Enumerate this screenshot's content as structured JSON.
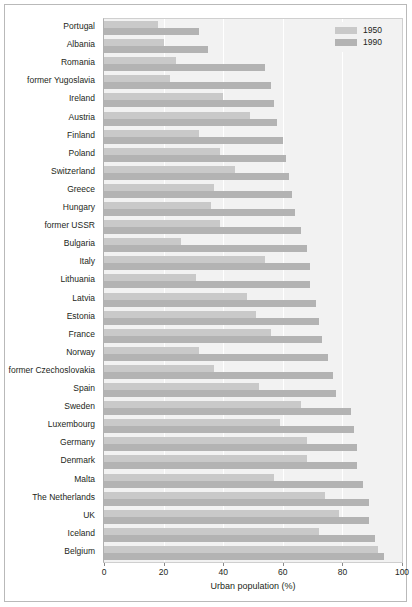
{
  "chart_data": {
    "type": "bar",
    "orientation": "horizontal",
    "title": "",
    "xlabel": "Urban population (%)",
    "ylabel": "",
    "xlim": [
      0,
      100
    ],
    "xticks": [
      0,
      20,
      40,
      60,
      80,
      100
    ],
    "grid": true,
    "legend_position": "top-right",
    "categories": [
      "Portugal",
      "Albania",
      "Romania",
      "former Yugoslavia",
      "Ireland",
      "Austria",
      "Finland",
      "Poland",
      "Switzerland",
      "Greece",
      "Hungary",
      "former USSR",
      "Bulgaria",
      "Italy",
      "Lithuania",
      "Latvia",
      "Estonia",
      "France",
      "Norway",
      "former Czechoslovakia",
      "Spain",
      "Sweden",
      "Luxembourg",
      "Germany",
      "Denmark",
      "Malta",
      "The Netherlands",
      "UK",
      "Iceland",
      "Belgium"
    ],
    "series": [
      {
        "name": "1950",
        "color": "#c9c9c9",
        "values": [
          18,
          20,
          24,
          22,
          40,
          49,
          32,
          39,
          44,
          37,
          36,
          39,
          26,
          54,
          31,
          48,
          51,
          56,
          32,
          37,
          52,
          66,
          59,
          68,
          68,
          57,
          74,
          79,
          72,
          92
        ]
      },
      {
        "name": "1990",
        "color": "#b3b3b3",
        "values": [
          32,
          35,
          54,
          56,
          57,
          58,
          60,
          61,
          62,
          63,
          64,
          66,
          68,
          69,
          69,
          71,
          72,
          73,
          75,
          77,
          78,
          83,
          84,
          85,
          85,
          87,
          89,
          89,
          91,
          94
        ]
      }
    ]
  },
  "axis": {
    "xtick_labels": [
      "0",
      "20",
      "40",
      "60",
      "80",
      "100"
    ],
    "xaxis_title": "Urban population (%)"
  },
  "legend": {
    "items": [
      {
        "label": "1950",
        "swatch": "legend-swatch-1950"
      },
      {
        "label": "1990",
        "swatch": "legend-swatch-1990"
      }
    ]
  },
  "colors": {
    "bar_1950": "#c9c9c9",
    "bar_1990": "#b3b3b3",
    "plot_background": "#f2f2f2",
    "gridline": "#ffffff",
    "frame": "#b9b9b9"
  }
}
